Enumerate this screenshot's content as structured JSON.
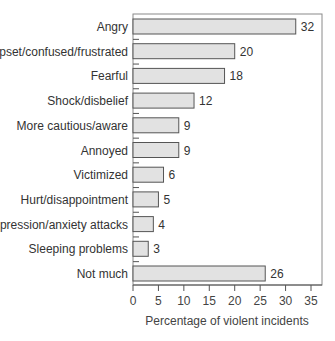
{
  "chart_data": {
    "type": "bar",
    "orientation": "horizontal",
    "title": "",
    "xlabel": "Percentage of violent incidents",
    "ylabel": "",
    "xlim": [
      0,
      37
    ],
    "xticks": [
      0,
      5,
      10,
      15,
      20,
      25,
      30,
      35
    ],
    "grid": false,
    "categories": [
      "Angry",
      "Upset/confused/frustrated",
      "Fearful",
      "Shock/disbelief",
      "More cautious/aware",
      "Annoyed",
      "Victimized",
      "Hurt/disappointment",
      "Depression/anxiety attacks",
      "Sleeping problems",
      "Not much"
    ],
    "values": [
      32,
      20,
      18,
      12,
      9,
      9,
      6,
      5,
      4,
      3,
      26
    ],
    "data_labels": [
      "32",
      "20",
      "18",
      "12",
      "9",
      "9",
      "6",
      "5",
      "4",
      "3",
      "26"
    ],
    "colors": {
      "bar_fill": "#e2e2e2",
      "bar_stroke": "#555555",
      "frame": "#888888"
    }
  }
}
